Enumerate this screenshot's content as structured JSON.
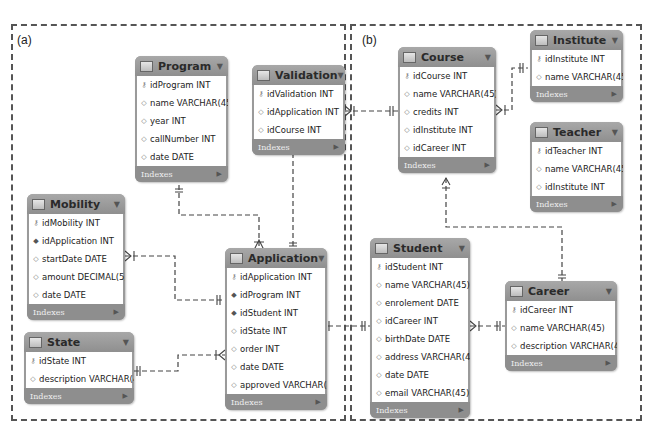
{
  "panels": [
    {
      "label": "(a)"
    },
    {
      "label": "(b)"
    }
  ],
  "indexes_label": "Indexes",
  "tables": {
    "program": {
      "name": "Program",
      "columns": [
        {
          "key": "pk",
          "text": "idProgram INT"
        },
        {
          "key": "col",
          "text": "name VARCHAR(45)"
        },
        {
          "key": "col",
          "text": "year INT"
        },
        {
          "key": "col",
          "text": "callNumber INT"
        },
        {
          "key": "col",
          "text": "date DATE"
        }
      ]
    },
    "validation": {
      "name": "Validation",
      "columns": [
        {
          "key": "pk",
          "text": "idValidation INT"
        },
        {
          "key": "col",
          "text": "idApplication INT"
        },
        {
          "key": "col",
          "text": "idCourse INT"
        }
      ]
    },
    "mobility": {
      "name": "Mobility",
      "columns": [
        {
          "key": "pk",
          "text": "idMobility INT"
        },
        {
          "key": "fk",
          "text": "idApplication INT"
        },
        {
          "key": "col",
          "text": "startDate DATE"
        },
        {
          "key": "col",
          "text": "amount DECIMAL(5,2)"
        },
        {
          "key": "col",
          "text": "date DATE"
        }
      ]
    },
    "state": {
      "name": "State",
      "columns": [
        {
          "key": "pk",
          "text": "idState INT"
        },
        {
          "key": "col",
          "text": "description VARCHAR(45)"
        }
      ]
    },
    "application": {
      "name": "Application",
      "columns": [
        {
          "key": "pk",
          "text": "idApplication INT"
        },
        {
          "key": "fk",
          "text": "idProgram INT"
        },
        {
          "key": "fk",
          "text": "idStudent INT"
        },
        {
          "key": "col",
          "text": "idState INT"
        },
        {
          "key": "col",
          "text": "order INT"
        },
        {
          "key": "col",
          "text": "date DATE"
        },
        {
          "key": "col",
          "text": "approved VARCHAR(45)"
        }
      ]
    },
    "course": {
      "name": "Course",
      "columns": [
        {
          "key": "pk",
          "text": "idCourse INT"
        },
        {
          "key": "col",
          "text": "name VARCHAR(45)"
        },
        {
          "key": "col",
          "text": "credits INT"
        },
        {
          "key": "col",
          "text": "idInstitute INT"
        },
        {
          "key": "col",
          "text": "idCareer INT"
        }
      ]
    },
    "institute": {
      "name": "Institute",
      "columns": [
        {
          "key": "pk",
          "text": "idInstitute INT"
        },
        {
          "key": "col",
          "text": "name VARCHAR(45)"
        }
      ]
    },
    "teacher": {
      "name": "Teacher",
      "columns": [
        {
          "key": "pk",
          "text": "idTeacher INT"
        },
        {
          "key": "col",
          "text": "name VARCHAR(45)"
        },
        {
          "key": "col",
          "text": "idInstitute INT"
        }
      ]
    },
    "student": {
      "name": "Student",
      "columns": [
        {
          "key": "pk",
          "text": "idStudent INT"
        },
        {
          "key": "col",
          "text": "name VARCHAR(45)"
        },
        {
          "key": "col",
          "text": "enrolement DATE"
        },
        {
          "key": "col",
          "text": "idCareer INT"
        },
        {
          "key": "col",
          "text": "birthDate DATE"
        },
        {
          "key": "col",
          "text": "address VARCHAR(45)"
        },
        {
          "key": "col",
          "text": "date DATE"
        },
        {
          "key": "col",
          "text": "email VARCHAR(45)"
        }
      ]
    },
    "career": {
      "name": "Career",
      "columns": [
        {
          "key": "pk",
          "text": "idCareer INT"
        },
        {
          "key": "col",
          "text": "name VARCHAR(45)"
        },
        {
          "key": "col",
          "text": "description VARCHAR(45)"
        }
      ]
    }
  },
  "relationships": [
    {
      "from": "Program",
      "to": "Application",
      "type": "one-to-many"
    },
    {
      "from": "Validation",
      "to": "Application",
      "type": "many-to-one"
    },
    {
      "from": "Validation",
      "to": "Course",
      "type": "many-to-one"
    },
    {
      "from": "Mobility",
      "to": "Application",
      "type": "many-to-one"
    },
    {
      "from": "State",
      "to": "Application",
      "type": "one-to-many"
    },
    {
      "from": "Application",
      "to": "Student",
      "type": "many-to-one"
    },
    {
      "from": "Course",
      "to": "Institute",
      "type": "many-to-one"
    },
    {
      "from": "Course",
      "to": "Career",
      "type": "many-to-one"
    },
    {
      "from": "Teacher",
      "to": "Institute",
      "type": "many-to-one"
    },
    {
      "from": "Student",
      "to": "Career",
      "type": "many-to-one"
    }
  ],
  "key_icons": {
    "pk": "key-icon",
    "fk": "foreign-key-diamond-icon",
    "col": "column-diamond-icon"
  }
}
